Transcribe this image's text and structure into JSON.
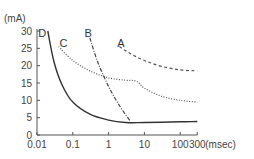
{
  "chart_data": {
    "type": "line",
    "title": "",
    "xlabel": "(msec)",
    "ylabel": "(mA)",
    "xscale": "log",
    "xlim": [
      0.01,
      300
    ],
    "ylim": [
      0,
      30
    ],
    "grid": false,
    "x_ticks": [
      {
        "value": 0.01,
        "label": "0.01"
      },
      {
        "value": 0.1,
        "label": "0.1"
      },
      {
        "value": 1,
        "label": "1"
      },
      {
        "value": 10,
        "label": "10"
      },
      {
        "value": 100,
        "label": "100"
      },
      {
        "value": 300,
        "label": "300"
      }
    ],
    "y_ticks": [
      {
        "value": 0,
        "label": "0"
      },
      {
        "value": 5,
        "label": "5"
      },
      {
        "value": 10,
        "label": "10"
      },
      {
        "value": 15,
        "label": "15"
      },
      {
        "value": 20,
        "label": "20"
      },
      {
        "value": 25,
        "label": "25"
      },
      {
        "value": 30,
        "label": "30"
      }
    ],
    "series": [
      {
        "name": "A",
        "style": "dashed",
        "label_at": [
          2.2,
          26.5
        ],
        "points": [
          [
            2,
            25.5
          ],
          [
            4,
            23.5
          ],
          [
            10,
            21.5
          ],
          [
            30,
            19.8
          ],
          [
            100,
            18.8
          ],
          [
            300,
            18.5
          ]
        ]
      },
      {
        "name": "B",
        "style": "dashdot",
        "label_at": [
          0.27,
          29.5
        ],
        "points": [
          [
            0.3,
            28
          ],
          [
            0.5,
            21
          ],
          [
            1,
            14
          ],
          [
            2,
            8.5
          ],
          [
            4,
            4
          ]
        ]
      },
      {
        "name": "C",
        "style": "dotted",
        "label_at": [
          0.055,
          26.5
        ],
        "points": [
          [
            0.04,
            25.5
          ],
          [
            0.1,
            21.5
          ],
          [
            0.3,
            18.5
          ],
          [
            1,
            16.5
          ],
          [
            3,
            15.8
          ],
          [
            6,
            15.5
          ],
          [
            10,
            13.5
          ],
          [
            30,
            11.2
          ],
          [
            100,
            10
          ],
          [
            300,
            9.5
          ]
        ]
      },
      {
        "name": "D",
        "style": "solid",
        "label_at": [
          0.014,
          29.5
        ],
        "points": [
          [
            0.02,
            30
          ],
          [
            0.03,
            21
          ],
          [
            0.05,
            14.5
          ],
          [
            0.1,
            9.5
          ],
          [
            0.3,
            6
          ],
          [
            1,
            4.3
          ],
          [
            3,
            3.6
          ],
          [
            10,
            3.6
          ],
          [
            100,
            3.8
          ],
          [
            300,
            3.9
          ]
        ]
      }
    ]
  }
}
